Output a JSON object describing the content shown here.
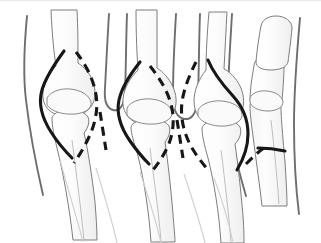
{
  "figure": {
    "alt_text": "Line drawing of the dorsal aspect of a hand showing metacarpal bones, proximal phalanges and the metacarpophalangeal joints, with collateral ligaments traced as solid and dashed black lines",
    "domain_label": "anatomical-line-drawing",
    "background_color": "#ffffff",
    "canvas": {
      "width": 321,
      "height": 243
    }
  },
  "style": {
    "bone_outline_color": "#4a4a4a",
    "bone_outline_light_color": "#9a9a9a",
    "bone_fill_color": "#fbfbfb",
    "bone_shade_color": "#f0f0f0",
    "soft_tissue_color": "#6e6e6e",
    "ligament_solid_color": "#171717",
    "ligament_dashed_color": "#171717",
    "top_border_color": "#e9e9e9",
    "ligament_solid_width": 3.1,
    "ligament_dashed_width": 3.1,
    "dash_pattern": "9 6",
    "bone_outline_width": 1.0,
    "soft_tissue_width": 1.9
  },
  "annotations": {
    "ligaments": [
      {
        "id": "lig-solid-1",
        "label": "collateral ligament index radial side",
        "style": "solid"
      },
      {
        "id": "lig-dashed-1",
        "label": "collateral ligament index ulnar side",
        "style": "dashed"
      },
      {
        "id": "lig-solid-2",
        "label": "collateral ligament middle radial side",
        "style": "solid"
      },
      {
        "id": "lig-dashed-2",
        "label": "collateral ligament middle ulnar side",
        "style": "dashed"
      },
      {
        "id": "lig-solid-3",
        "label": "collateral ligament ring radial side",
        "style": "solid"
      },
      {
        "id": "lig-dashed-3",
        "label": "collateral ligament ring ulnar side",
        "style": "dashed"
      },
      {
        "id": "lig-solid-4",
        "label": "collateral ligament thumb radial side",
        "style": "solid"
      },
      {
        "id": "lig-dashed-4",
        "label": "collateral ligament thumb ulnar side",
        "style": "dashed"
      }
    ],
    "bones": [
      {
        "id": "metacarpal-1",
        "label": "thumb metacarpal"
      },
      {
        "id": "metacarpal-2",
        "label": "index metacarpal"
      },
      {
        "id": "metacarpal-3",
        "label": "middle metacarpal"
      },
      {
        "id": "metacarpal-4",
        "label": "ring metacarpal"
      },
      {
        "id": "metacarpal-5",
        "label": "little metacarpal"
      },
      {
        "id": "phalanx-prox-1",
        "label": "thumb proximal phalanx"
      },
      {
        "id": "phalanx-prox-2",
        "label": "index proximal phalanx"
      },
      {
        "id": "phalanx-prox-3",
        "label": "middle proximal phalanx"
      },
      {
        "id": "phalanx-prox-4",
        "label": "ring proximal phalanx"
      },
      {
        "id": "phalanx-dist-1",
        "label": "thumb distal phalanx"
      }
    ],
    "joints": [
      {
        "id": "mcp-joint-2",
        "label": "index metacarpophalangeal joint"
      },
      {
        "id": "mcp-joint-3",
        "label": "middle metacarpophalangeal joint"
      },
      {
        "id": "mcp-joint-4",
        "label": "ring metacarpophalangeal joint"
      },
      {
        "id": "mcp-joint-1",
        "label": "thumb metacarpophalangeal joint"
      }
    ]
  }
}
